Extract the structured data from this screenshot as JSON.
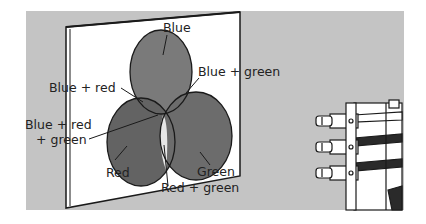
{
  "figure": {
    "colors": {
      "background": "#c4c4c4",
      "screen": "#ffffff",
      "blue_light": "#7a7a7a",
      "red_light": "#646464",
      "green_light": "#6e6e6e",
      "overlap_white": "#e8e8e8",
      "outline": "#1a1a1a"
    },
    "labels": {
      "blue": "Blue",
      "blue_green": "Blue + green",
      "blue_red": "Blue + red",
      "blue_red_green_line1": "Blue + red",
      "blue_red_green_line2": "+ green",
      "red": "Red",
      "green": "Green",
      "red_green": "Red + green"
    },
    "projector": {
      "lamp_count": 3
    }
  }
}
